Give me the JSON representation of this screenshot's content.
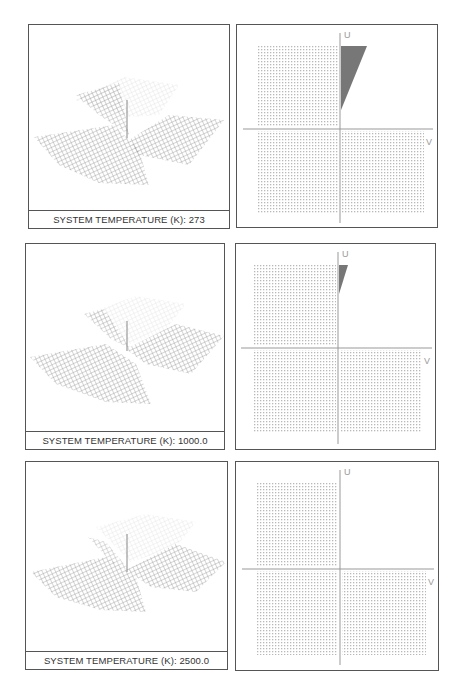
{
  "figure": {
    "rows": [
      {
        "surface_panel": {
          "label_prefix": "SYSTEM TEMPERATURE (K):",
          "temperature": "273",
          "label": "SYSTEM TEMPERATURE (K): 273"
        },
        "phase_panel": {
          "u_axis_label": "U",
          "v_axis_label": "V",
          "wedge_size": "large"
        }
      },
      {
        "surface_panel": {
          "label_prefix": "SYSTEM TEMPERATURE (K):",
          "temperature": "1000.0",
          "label": "SYSTEM TEMPERATURE (K): 1000.0"
        },
        "phase_panel": {
          "u_axis_label": "U",
          "v_axis_label": "V",
          "wedge_size": "small"
        }
      },
      {
        "surface_panel": {
          "label_prefix": "SYSTEM TEMPERATURE (K):",
          "temperature": "2500.0",
          "label": "SYSTEM TEMPERATURE (K): 2500.0"
        },
        "phase_panel": {
          "u_axis_label": "U",
          "v_axis_label": "V",
          "wedge_size": "none"
        }
      }
    ],
    "colors": {
      "border": "#555555",
      "grid_dots": "#b8b8b8",
      "axis": "#999999",
      "wedge": "#777777",
      "surface_mesh": "#8a8a8a"
    }
  }
}
